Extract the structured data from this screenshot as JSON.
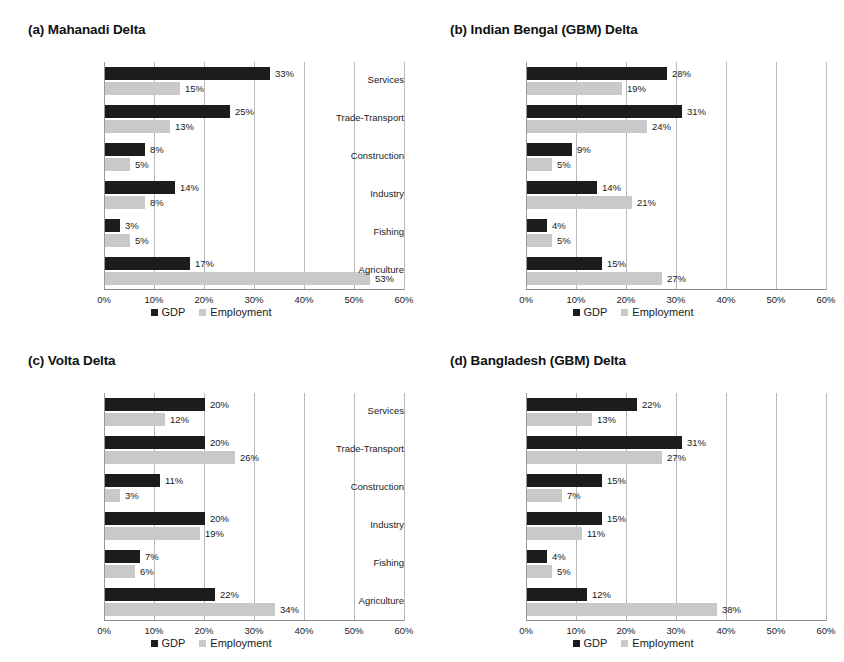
{
  "figure": {
    "categories": [
      "Agriculture",
      "Fishing",
      "Industry",
      "Construction",
      "Trade-Transport",
      "Services"
    ],
    "series_names": [
      "GDP",
      "Employment"
    ],
    "legend": {
      "gdp_label": "GDP",
      "employment_label": "Employment"
    },
    "axis": {
      "ticks": [
        "0%",
        "10%",
        "20%",
        "30%",
        "40%",
        "50%",
        "60%"
      ],
      "tick_values": [
        0,
        10,
        20,
        30,
        40,
        50,
        60
      ],
      "xmin": 0,
      "xmax": 60
    },
    "colors": {
      "gdp": "#1c1c1c",
      "employment": "#c9c9c9",
      "gridline": "#b9b9b9",
      "axis": "#8a8a8a",
      "text": "#1a1a1a",
      "background": "#ffffff"
    }
  },
  "chart_data": [
    {
      "type": "bar",
      "title": "(a) Mahanadi Delta",
      "orientation": "horizontal",
      "categories": [
        "Agriculture",
        "Fishing",
        "Industry",
        "Construction",
        "Trade-Transport",
        "Services"
      ],
      "series": [
        {
          "name": "GDP",
          "values": [
            17,
            3,
            14,
            8,
            25,
            33
          ],
          "labels": [
            "17%",
            "3%",
            "14%",
            "8%",
            "25%",
            "33%"
          ]
        },
        {
          "name": "Employment",
          "values": [
            53,
            5,
            8,
            5,
            13,
            15
          ],
          "labels": [
            "53%",
            "5%",
            "8%",
            "5%",
            "13%",
            "15%"
          ]
        }
      ],
      "xlabel": "",
      "ylabel": "",
      "xlim": [
        0,
        60
      ],
      "grid": true,
      "legend_position": "bottom"
    },
    {
      "type": "bar",
      "title": "(b) Indian Bengal (GBM) Delta",
      "orientation": "horizontal",
      "categories": [
        "Agriculture",
        "Fishing",
        "Industry",
        "Construction",
        "Trade-Transport",
        "Services"
      ],
      "series": [
        {
          "name": "GDP",
          "values": [
            15,
            4,
            14,
            9,
            31,
            28
          ],
          "labels": [
            "15%",
            "4%",
            "14%",
            "9%",
            "31%",
            "28%"
          ]
        },
        {
          "name": "Employment",
          "values": [
            27,
            5,
            21,
            5,
            24,
            19
          ],
          "labels": [
            "27%",
            "5%",
            "21%",
            "5%",
            "24%",
            "19%"
          ]
        }
      ],
      "xlabel": "",
      "ylabel": "",
      "xlim": [
        0,
        60
      ],
      "grid": true,
      "legend_position": "bottom"
    },
    {
      "type": "bar",
      "title": "(c) Volta Delta",
      "orientation": "horizontal",
      "categories": [
        "Agriculture",
        "Fishing",
        "Industry",
        "Construction",
        "Trade-Transport",
        "Services"
      ],
      "series": [
        {
          "name": "GDP",
          "values": [
            22,
            7,
            20,
            11,
            20,
            20
          ],
          "labels": [
            "22%",
            "7%",
            "20%",
            "11%",
            "20%",
            "20%"
          ]
        },
        {
          "name": "Employment",
          "values": [
            34,
            6,
            19,
            3,
            26,
            12
          ],
          "labels": [
            "34%",
            "6%",
            "19%",
            "3%",
            "26%",
            "12%"
          ]
        }
      ],
      "xlabel": "",
      "ylabel": "",
      "xlim": [
        0,
        60
      ],
      "grid": true,
      "legend_position": "bottom"
    },
    {
      "type": "bar",
      "title": "(d) Bangladesh (GBM) Delta",
      "orientation": "horizontal",
      "categories": [
        "Agriculture",
        "Fishing",
        "Industry",
        "Construction",
        "Trade-Transport",
        "Services"
      ],
      "series": [
        {
          "name": "GDP",
          "values": [
            12,
            4,
            15,
            15,
            31,
            22
          ],
          "labels": [
            "12%",
            "4%",
            "15%",
            "15%",
            "31%",
            "22%"
          ]
        },
        {
          "name": "Employment",
          "values": [
            38,
            5,
            11,
            7,
            27,
            13
          ],
          "labels": [
            "38%",
            "5%",
            "11%",
            "7%",
            "27%",
            "13%"
          ]
        }
      ],
      "xlabel": "",
      "ylabel": "",
      "xlim": [
        0,
        60
      ],
      "grid": true,
      "legend_position": "bottom"
    }
  ]
}
